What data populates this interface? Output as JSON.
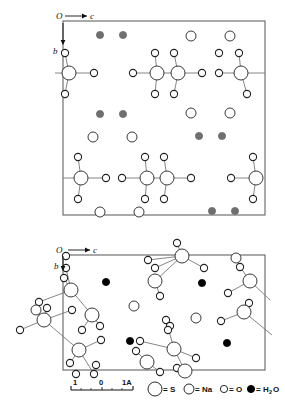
{
  "figure": {
    "type": "crystal-structure-projection",
    "panels": [
      {
        "id": "top",
        "name": "upper-projection",
        "axes": {
          "origin_label": "O",
          "horizontal_label": "c",
          "vertical_label": "b"
        },
        "frame": {
          "x": 63,
          "y": 21,
          "w": 202,
          "h": 194
        },
        "water_color": "#6f6f6f"
      },
      {
        "id": "bottom",
        "name": "lower-projection",
        "axes": {
          "origin_label": "O",
          "horizontal_label": "c",
          "vertical_label": "b"
        },
        "frame": {
          "x": 63,
          "y": 255,
          "w": 202,
          "h": 115
        },
        "water_color": "#000000"
      }
    ],
    "scale_bar": {
      "ticks": [
        "1",
        "0",
        "1A"
      ],
      "unit": "Å",
      "labels": {
        "left": "1",
        "middle": "0",
        "right": "1A"
      }
    },
    "legend": {
      "items": [
        {
          "symbol": "circle-large-open",
          "eq": "=",
          "label": "S",
          "radius": 7.0,
          "fill": "#ffffff",
          "stroke": "#111111"
        },
        {
          "symbol": "circle-medium-open",
          "eq": "=",
          "label": "Na",
          "radius": 5.0,
          "fill": "#ffffff",
          "stroke": "#111111"
        },
        {
          "symbol": "circle-small-open",
          "eq": "=",
          "label": "O",
          "radius": 3.6,
          "fill": "#ffffff",
          "stroke": "#111111"
        },
        {
          "symbol": "circle-small-filled",
          "eq": "=",
          "label": "H",
          "sub": "2",
          "label2": "O",
          "radius": 3.6,
          "fill": "#000000",
          "stroke": "#000000"
        }
      ]
    },
    "colors": {
      "frame": "#555555",
      "bond": "#777777",
      "atom_stroke": "#222222",
      "atom_fill": "#ffffff",
      "water_top": "#6f6f6f",
      "water_bottom": "#000000"
    }
  },
  "chart_data": {
    "type": "scatter",
    "title": "",
    "xlabel": "c",
    "ylabel": "b",
    "grid": false,
    "legend_position": "bottom",
    "species": [
      "S",
      "Na",
      "O",
      "H2O"
    ],
    "radii": {
      "S": 7.0,
      "Na": 5.0,
      "O": 3.6,
      "H2O": 3.6
    },
    "panel_top": {
      "frame": [
        63,
        21,
        265,
        215
      ],
      "atoms": [
        {
          "s": "H2O",
          "x": 100,
          "y": 35
        },
        {
          "s": "H2O",
          "x": 123,
          "y": 35
        },
        {
          "s": "Na",
          "x": 191,
          "y": 36
        },
        {
          "s": "Na",
          "x": 230,
          "y": 36
        },
        {
          "s": "O",
          "x": 65,
          "y": 53
        },
        {
          "s": "O",
          "x": 219,
          "y": 53
        },
        {
          "s": "O",
          "x": 239,
          "y": 53
        },
        {
          "s": "O",
          "x": 155,
          "y": 53
        },
        {
          "s": "O",
          "x": 174,
          "y": 53
        },
        {
          "s": "S",
          "x": 69,
          "y": 73
        },
        {
          "s": "O",
          "x": 94,
          "y": 73
        },
        {
          "s": "S",
          "x": 157,
          "y": 73
        },
        {
          "s": "S",
          "x": 178,
          "y": 73
        },
        {
          "s": "O",
          "x": 133,
          "y": 73
        },
        {
          "s": "O",
          "x": 202,
          "y": 73
        },
        {
          "s": "S",
          "x": 241,
          "y": 73
        },
        {
          "s": "O",
          "x": 219,
          "y": 73
        },
        {
          "s": "O",
          "x": 65,
          "y": 94
        },
        {
          "s": "O",
          "x": 155,
          "y": 94
        },
        {
          "s": "O",
          "x": 174,
          "y": 94
        },
        {
          "s": "O",
          "x": 247,
          "y": 94
        },
        {
          "s": "H2O",
          "x": 100,
          "y": 114
        },
        {
          "s": "H2O",
          "x": 123,
          "y": 114
        },
        {
          "s": "Na",
          "x": 191,
          "y": 113
        },
        {
          "s": "Na",
          "x": 230,
          "y": 113
        },
        {
          "s": "Na",
          "x": 93,
          "y": 137
        },
        {
          "s": "Na",
          "x": 132,
          "y": 137
        },
        {
          "s": "H2O",
          "x": 199,
          "y": 136
        },
        {
          "s": "H2O",
          "x": 222,
          "y": 136
        },
        {
          "s": "O",
          "x": 78,
          "y": 157
        },
        {
          "s": "O",
          "x": 145,
          "y": 157
        },
        {
          "s": "O",
          "x": 164,
          "y": 157
        },
        {
          "s": "O",
          "x": 253,
          "y": 157
        },
        {
          "s": "S",
          "x": 81,
          "y": 178
        },
        {
          "s": "O",
          "x": 106,
          "y": 178
        },
        {
          "s": "S",
          "x": 147,
          "y": 178
        },
        {
          "s": "S",
          "x": 167,
          "y": 178
        },
        {
          "s": "O",
          "x": 122,
          "y": 178
        },
        {
          "s": "O",
          "x": 191,
          "y": 178
        },
        {
          "s": "S",
          "x": 256,
          "y": 178
        },
        {
          "s": "O",
          "x": 231,
          "y": 178
        },
        {
          "s": "O",
          "x": 78,
          "y": 199
        },
        {
          "s": "O",
          "x": 145,
          "y": 199
        },
        {
          "s": "O",
          "x": 164,
          "y": 199
        },
        {
          "s": "O",
          "x": 253,
          "y": 199
        },
        {
          "s": "Na",
          "x": 100,
          "y": 212
        },
        {
          "s": "Na",
          "x": 139,
          "y": 212
        },
        {
          "s": "H2O",
          "x": 212,
          "y": 211
        },
        {
          "s": "H2O",
          "x": 235,
          "y": 211
        }
      ],
      "bonds": [
        [
          69,
          73,
          65,
          53
        ],
        [
          69,
          73,
          65,
          94
        ],
        [
          69,
          73,
          94,
          73
        ],
        [
          69,
          73,
          55,
          73
        ],
        [
          157,
          73,
          155,
          53
        ],
        [
          157,
          73,
          155,
          94
        ],
        [
          157,
          73,
          133,
          73
        ],
        [
          157,
          73,
          178,
          73
        ],
        [
          178,
          73,
          174,
          53
        ],
        [
          178,
          73,
          174,
          94
        ],
        [
          178,
          73,
          202,
          73
        ],
        [
          241,
          73,
          239,
          53
        ],
        [
          241,
          73,
          247,
          94
        ],
        [
          241,
          73,
          219,
          73
        ],
        [
          241,
          73,
          265,
          73
        ],
        [
          81,
          178,
          78,
          157
        ],
        [
          81,
          178,
          78,
          199
        ],
        [
          81,
          178,
          106,
          178
        ],
        [
          81,
          178,
          63,
          178
        ],
        [
          147,
          178,
          145,
          157
        ],
        [
          147,
          178,
          145,
          199
        ],
        [
          147,
          178,
          122,
          178
        ],
        [
          147,
          178,
          167,
          178
        ],
        [
          167,
          178,
          164,
          157
        ],
        [
          167,
          178,
          164,
          199
        ],
        [
          167,
          178,
          191,
          178
        ],
        [
          256,
          178,
          253,
          157
        ],
        [
          256,
          178,
          253,
          199
        ],
        [
          256,
          178,
          231,
          178
        ]
      ]
    },
    "panel_bottom": {
      "frame": [
        63,
        255,
        265,
        370
      ],
      "atoms": [
        {
          "s": "O",
          "x": 66,
          "y": 256
        },
        {
          "s": "O",
          "x": 66,
          "y": 268
        },
        {
          "s": "O",
          "x": 64,
          "y": 278
        },
        {
          "s": "S",
          "x": 71,
          "y": 290
        },
        {
          "s": "O",
          "x": 39,
          "y": 302
        },
        {
          "s": "Na",
          "x": 36,
          "y": 310
        },
        {
          "s": "S",
          "x": 44,
          "y": 320
        },
        {
          "s": "O",
          "x": 47,
          "y": 308
        },
        {
          "s": "O",
          "x": 20,
          "y": 330
        },
        {
          "s": "O",
          "x": 72,
          "y": 310
        },
        {
          "s": "O",
          "x": 95,
          "y": 316
        },
        {
          "s": "S",
          "x": 92,
          "y": 315
        },
        {
          "s": "O",
          "x": 82,
          "y": 330
        },
        {
          "s": "O",
          "x": 100,
          "y": 326
        },
        {
          "s": "S",
          "x": 79,
          "y": 350
        },
        {
          "s": "O",
          "x": 101,
          "y": 340
        },
        {
          "s": "O",
          "x": 70,
          "y": 363
        },
        {
          "s": "O",
          "x": 94,
          "y": 374
        },
        {
          "s": "H2O",
          "x": 106,
          "y": 282
        },
        {
          "s": "H2O",
          "x": 130,
          "y": 341
        },
        {
          "s": "Na",
          "x": 134,
          "y": 306
        },
        {
          "s": "Na",
          "x": 196,
          "y": 318
        },
        {
          "s": "O",
          "x": 177,
          "y": 243
        },
        {
          "s": "O",
          "x": 148,
          "y": 260
        },
        {
          "s": "O",
          "x": 155,
          "y": 268
        },
        {
          "s": "S",
          "x": 182,
          "y": 256
        },
        {
          "s": "O",
          "x": 204,
          "y": 268
        },
        {
          "s": "S",
          "x": 155,
          "y": 281
        },
        {
          "s": "O",
          "x": 160,
          "y": 296
        },
        {
          "s": "H2O",
          "x": 202,
          "y": 283
        },
        {
          "s": "H2O",
          "x": 227,
          "y": 343
        },
        {
          "s": "Na",
          "x": 236,
          "y": 258
        },
        {
          "s": "O",
          "x": 240,
          "y": 267
        },
        {
          "s": "S",
          "x": 250,
          "y": 281
        },
        {
          "s": "O",
          "x": 228,
          "y": 293
        },
        {
          "s": "O",
          "x": 249,
          "y": 303
        },
        {
          "s": "S",
          "x": 244,
          "y": 312
        },
        {
          "s": "O",
          "x": 221,
          "y": 321
        },
        {
          "s": "O",
          "x": 166,
          "y": 320
        },
        {
          "s": "O",
          "x": 170,
          "y": 326
        },
        {
          "s": "O",
          "x": 168,
          "y": 330
        },
        {
          "s": "S",
          "x": 174,
          "y": 349
        },
        {
          "s": "O",
          "x": 140,
          "y": 341
        },
        {
          "s": "S",
          "x": 147,
          "y": 362
        },
        {
          "s": "O",
          "x": 136,
          "y": 351
        },
        {
          "s": "O",
          "x": 196,
          "y": 358
        },
        {
          "s": "O",
          "x": 177,
          "y": 368
        },
        {
          "s": "S",
          "x": 185,
          "y": 371
        },
        {
          "s": "O",
          "x": 160,
          "y": 372
        },
        {
          "s": "O",
          "x": 96,
          "y": 365
        },
        {
          "s": "O",
          "x": 76,
          "y": 374
        }
      ],
      "bonds": [
        [
          71,
          290,
          66,
          268
        ],
        [
          71,
          290,
          64,
          278
        ],
        [
          71,
          290,
          39,
          302
        ],
        [
          71,
          290,
          92,
          315
        ],
        [
          44,
          320,
          36,
          310
        ],
        [
          44,
          320,
          47,
          308
        ],
        [
          44,
          320,
          20,
          330
        ],
        [
          44,
          320,
          72,
          310
        ],
        [
          44,
          320,
          79,
          350
        ],
        [
          92,
          315,
          82,
          330
        ],
        [
          92,
          315,
          100,
          326
        ],
        [
          79,
          350,
          101,
          340
        ],
        [
          79,
          350,
          70,
          363
        ],
        [
          79,
          350,
          94,
          374
        ],
        [
          182,
          256,
          148,
          260
        ],
        [
          182,
          256,
          155,
          268
        ],
        [
          182,
          256,
          204,
          268
        ],
        [
          182,
          256,
          155,
          281
        ],
        [
          182,
          256,
          177,
          243
        ],
        [
          155,
          281,
          160,
          296
        ],
        [
          250,
          281,
          240,
          267
        ],
        [
          250,
          281,
          228,
          293
        ],
        [
          250,
          281,
          270,
          300
        ],
        [
          244,
          312,
          249,
          303
        ],
        [
          244,
          312,
          221,
          321
        ],
        [
          244,
          312,
          272,
          335
        ],
        [
          174,
          349,
          166,
          320
        ],
        [
          174,
          349,
          140,
          341
        ],
        [
          174,
          349,
          196,
          358
        ],
        [
          174,
          349,
          185,
          371
        ],
        [
          147,
          362,
          136,
          351
        ],
        [
          147,
          362,
          160,
          372
        ]
      ]
    }
  }
}
